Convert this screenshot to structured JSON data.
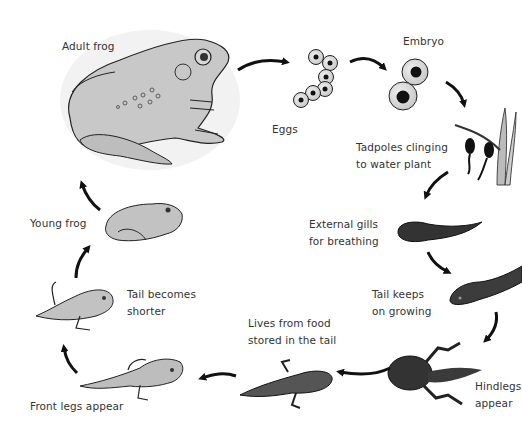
{
  "diagram": {
    "stages": [
      {
        "id": "adult-frog",
        "label": "Adult frog"
      },
      {
        "id": "eggs",
        "label": "Eggs"
      },
      {
        "id": "embryo",
        "label": "Embryo"
      },
      {
        "id": "tadpoles-clinging",
        "label_line1": "Tadpoles clinging",
        "label_line2": "to water plant"
      },
      {
        "id": "external-gills",
        "label_line1": "External gills",
        "label_line2": "for breathing"
      },
      {
        "id": "tail-keeps-growing",
        "label_line1": "Tail keeps",
        "label_line2": "on growing"
      },
      {
        "id": "hindlegs-appear",
        "label_line1": "Hindlegs",
        "label_line2": "appear"
      },
      {
        "id": "lives-from-food",
        "label_line1": "Lives from food",
        "label_line2": "stored in the tail"
      },
      {
        "id": "front-legs-appear",
        "label": "Front legs appear"
      },
      {
        "id": "tail-becomes-shorter",
        "label_line1": "Tail becomes",
        "label_line2": "shorter"
      },
      {
        "id": "young-frog",
        "label": "Young frog"
      }
    ],
    "colors": {
      "ink": "#111111",
      "frog_fill": "#c8c8c8",
      "tadpole_fill": "#3a3a3a",
      "background": "#ffffff"
    }
  }
}
